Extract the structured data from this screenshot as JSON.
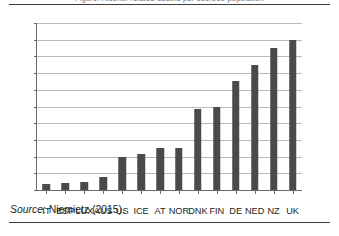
{
  "figure": {
    "title_sliver": "Figure: Alcohol-related deaths per 100,000 population",
    "source_prefix": "Source",
    "source_separator": ": ",
    "source_text": "Niemietz (2015)."
  },
  "chart_data": {
    "type": "bar",
    "title": "",
    "xlabel": "",
    "ylabel": "",
    "categories": [
      "IT",
      "ESP",
      "LUX",
      "AUS",
      "US",
      "ICE",
      "AT",
      "NOR",
      "DNK",
      "FIN",
      "DE",
      "NED",
      "NZ",
      "UK"
    ],
    "values": [
      0.7,
      0.9,
      1.0,
      1.5,
      4.0,
      4.3,
      5.0,
      5.0,
      9.7,
      10.0,
      13.0,
      15.0,
      17.0,
      18.0
    ],
    "ylim": [
      0,
      20
    ],
    "ytick_values": [
      0,
      2,
      4,
      6,
      8,
      10,
      12,
      14,
      16,
      18,
      20
    ],
    "ytick_labels": [
      "0",
      "2",
      "4",
      "6",
      "8",
      "10",
      "12",
      "14",
      "16",
      "18",
      "20"
    ],
    "grid": true,
    "legend": false,
    "bar_color": "#4a4a4a",
    "grid_color": "#b9b9b9",
    "axis_color": "#6a6a6a"
  }
}
